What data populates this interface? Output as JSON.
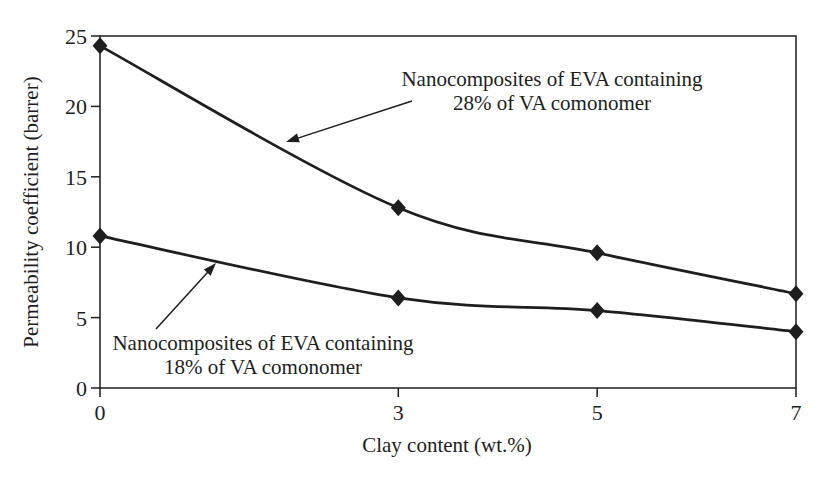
{
  "figure": {
    "background": "#ffffff",
    "ink": "#1e1e1e"
  },
  "chart_data": {
    "type": "line",
    "x": [
      0,
      3,
      5,
      7
    ],
    "x_ticks": [
      "0",
      "3",
      "5",
      "7"
    ],
    "y_ticks": [
      "0",
      "5",
      "10",
      "15",
      "20",
      "25"
    ],
    "xlim": [
      0,
      7
    ],
    "ylim": [
      0,
      25
    ],
    "xlabel": "Clay content (wt.%)",
    "ylabel": "Permeability coefficient (barrer)",
    "grid": false,
    "legend_position": "none",
    "marker": "filled-diamond",
    "line_style": "smooth",
    "line_color": "#1e1e1e",
    "series": [
      {
        "name": "Nanocomposites of EVA containing 28% of VA comonomer",
        "values": [
          24.3,
          12.8,
          9.6,
          6.7
        ]
      },
      {
        "name": "Nanocomposites of EVA containing 18% of VA comonomer",
        "values": [
          10.8,
          6.4,
          5.5,
          4.0
        ]
      }
    ],
    "annotations": [
      {
        "lines": [
          "Nanocomposites of EVA containing",
          "28% of VA comonomer"
        ],
        "arrow_points_to": "upper curve"
      },
      {
        "lines": [
          "Nanocomposites of EVA containing",
          "18% of VA comonomer"
        ],
        "arrow_points_to": "lower curve"
      }
    ]
  }
}
